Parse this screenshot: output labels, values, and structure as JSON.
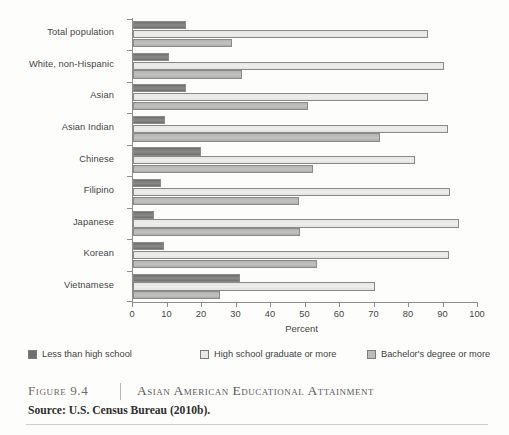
{
  "figure": {
    "number_label": "Figure 9.4",
    "title": "Asian American Educational Attainment",
    "source_label": "Source:",
    "source_text": "U.S. Census Bureau (2010b)."
  },
  "legend": {
    "position": "below-plot",
    "items": [
      {
        "label": "Less than high school",
        "color": "#6f6f6f"
      },
      {
        "label": "High school graduate or more",
        "color": "#e8e8e6"
      },
      {
        "label": "Bachelor's degree or more",
        "color": "#bcbcba"
      }
    ]
  },
  "axis": {
    "x_title": "Percent",
    "x_ticks": [
      "0",
      "10",
      "20",
      "30",
      "40",
      "50",
      "60",
      "70",
      "80",
      "90",
      "100"
    ]
  },
  "chart_data": {
    "type": "bar",
    "orientation": "horizontal",
    "title": "Asian American Educational Attainment",
    "xlabel": "Percent",
    "ylabel": "",
    "xlim": [
      0,
      100
    ],
    "grid": false,
    "legend_position": "bottom",
    "categories": [
      "Total population",
      "White, non-Hispanic",
      "Asian",
      "Asian Indian",
      "Chinese",
      "Filipino",
      "Japanese",
      "Korean",
      "Vietnamese"
    ],
    "series": [
      {
        "name": "Less than high school",
        "color": "#6f6f6f",
        "values": [
          15.3,
          10.5,
          15.3,
          9.4,
          19.6,
          8.2,
          6.2,
          9.1,
          31.1
        ]
      },
      {
        "name": "High school graduate or more",
        "color": "#e8e8e6",
        "values": [
          85.6,
          90.0,
          85.6,
          91.2,
          81.8,
          91.8,
          94.4,
          91.5,
          70.1
        ]
      },
      {
        "name": "Bachelor's degree or more",
        "color": "#bcbcba",
        "values": [
          28.7,
          31.6,
          50.7,
          71.5,
          52.2,
          48.0,
          48.4,
          53.4,
          25.2
        ]
      }
    ]
  }
}
